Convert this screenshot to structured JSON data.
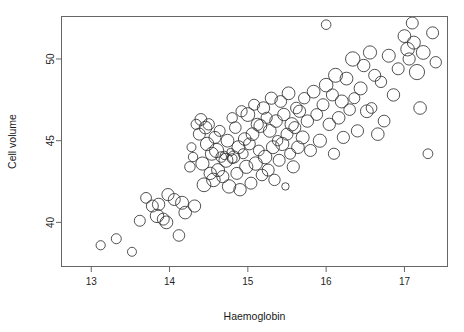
{
  "chart_data": {
    "type": "scatter",
    "variant": "bubble",
    "title": "",
    "subtitle": "",
    "xlabel": "Haemoglobin",
    "ylabel": "Cell volume",
    "xlim": [
      12.62,
      17.55
    ],
    "ylim": [
      37.3,
      52.6
    ],
    "xticks": [
      13,
      14,
      15,
      16,
      17
    ],
    "xticklabels": [
      "13",
      "14",
      "15",
      "16",
      "17"
    ],
    "yticks": [
      40,
      45,
      50
    ],
    "yticklabels": [
      "40",
      "45",
      "50"
    ],
    "grid": false,
    "legend": null,
    "marker": "open-circle",
    "marker_color": "#333333",
    "background": "#ffffff",
    "frame_color": "#666666",
    "annotations": [],
    "size_encoding": "circle radius proportional to a third variable (white cell count)",
    "n_points": 132,
    "points": [
      {
        "x": 13.12,
        "y": 38.6,
        "r": 9.2
      },
      {
        "x": 13.32,
        "y": 39.0,
        "r": 10.0
      },
      {
        "x": 13.52,
        "y": 38.2,
        "r": 9.0
      },
      {
        "x": 13.62,
        "y": 40.1,
        "r": 11.0
      },
      {
        "x": 13.7,
        "y": 41.5,
        "r": 10.8
      },
      {
        "x": 13.78,
        "y": 41.0,
        "r": 12.0
      },
      {
        "x": 13.84,
        "y": 40.4,
        "r": 13.5
      },
      {
        "x": 13.86,
        "y": 41.1,
        "r": 12.4
      },
      {
        "x": 13.92,
        "y": 40.2,
        "r": 12.0
      },
      {
        "x": 13.96,
        "y": 40.0,
        "r": 12.8
      },
      {
        "x": 13.98,
        "y": 41.7,
        "r": 12.2
      },
      {
        "x": 14.06,
        "y": 41.4,
        "r": 12.0
      },
      {
        "x": 14.12,
        "y": 39.2,
        "r": 11.6
      },
      {
        "x": 14.16,
        "y": 41.2,
        "r": 13.0
      },
      {
        "x": 14.2,
        "y": 40.6,
        "r": 12.6
      },
      {
        "x": 14.26,
        "y": 43.4,
        "r": 10.5
      },
      {
        "x": 14.28,
        "y": 44.6,
        "r": 9.0
      },
      {
        "x": 14.3,
        "y": 44.0,
        "r": 9.4
      },
      {
        "x": 14.32,
        "y": 41.0,
        "r": 12.2
      },
      {
        "x": 14.34,
        "y": 46.0,
        "r": 10.2
      },
      {
        "x": 14.38,
        "y": 45.4,
        "r": 12.0
      },
      {
        "x": 14.4,
        "y": 46.3,
        "r": 11.8
      },
      {
        "x": 14.42,
        "y": 43.6,
        "r": 13.2
      },
      {
        "x": 14.44,
        "y": 42.3,
        "r": 13.8
      },
      {
        "x": 14.46,
        "y": 45.8,
        "r": 12.6
      },
      {
        "x": 14.48,
        "y": 44.8,
        "r": 13.4
      },
      {
        "x": 14.5,
        "y": 46.0,
        "r": 11.4
      },
      {
        "x": 14.52,
        "y": 43.0,
        "r": 12.4
      },
      {
        "x": 14.54,
        "y": 44.2,
        "r": 13.0
      },
      {
        "x": 14.56,
        "y": 42.6,
        "r": 13.6
      },
      {
        "x": 14.58,
        "y": 45.2,
        "r": 12.0
      },
      {
        "x": 14.6,
        "y": 44.4,
        "r": 14.2
      },
      {
        "x": 14.62,
        "y": 43.2,
        "r": 13.0
      },
      {
        "x": 14.64,
        "y": 45.6,
        "r": 11.0
      },
      {
        "x": 14.66,
        "y": 44.0,
        "r": 10.6
      },
      {
        "x": 14.68,
        "y": 42.8,
        "r": 12.2
      },
      {
        "x": 14.7,
        "y": 44.1,
        "r": 8.4
      },
      {
        "x": 14.72,
        "y": 43.8,
        "r": 14.0
      },
      {
        "x": 14.74,
        "y": 45.0,
        "r": 12.8
      },
      {
        "x": 14.76,
        "y": 42.2,
        "r": 13.4
      },
      {
        "x": 14.78,
        "y": 44.3,
        "r": 7.6
      },
      {
        "x": 14.8,
        "y": 43.9,
        "r": 9.8
      },
      {
        "x": 14.8,
        "y": 46.4,
        "r": 10.4
      },
      {
        "x": 14.82,
        "y": 44.0,
        "r": 12.2
      },
      {
        "x": 14.84,
        "y": 45.8,
        "r": 11.6
      },
      {
        "x": 14.86,
        "y": 43.0,
        "r": 12.0
      },
      {
        "x": 14.88,
        "y": 44.6,
        "r": 13.0
      },
      {
        "x": 14.9,
        "y": 42.0,
        "r": 12.4
      },
      {
        "x": 14.92,
        "y": 46.8,
        "r": 11.2
      },
      {
        "x": 14.94,
        "y": 44.2,
        "r": 10.0
      },
      {
        "x": 14.96,
        "y": 45.1,
        "r": 12.6
      },
      {
        "x": 14.98,
        "y": 43.4,
        "r": 13.2
      },
      {
        "x": 15.0,
        "y": 46.6,
        "r": 13.8
      },
      {
        "x": 15.02,
        "y": 44.8,
        "r": 11.8
      },
      {
        "x": 15.04,
        "y": 42.4,
        "r": 12.0
      },
      {
        "x": 15.06,
        "y": 45.4,
        "r": 12.8
      },
      {
        "x": 15.08,
        "y": 47.2,
        "r": 11.0
      },
      {
        "x": 15.1,
        "y": 43.6,
        "r": 13.4
      },
      {
        "x": 15.12,
        "y": 46.0,
        "r": 12.2
      },
      {
        "x": 15.14,
        "y": 44.4,
        "r": 10.8
      },
      {
        "x": 15.16,
        "y": 45.9,
        "r": 13.0
      },
      {
        "x": 15.18,
        "y": 42.9,
        "r": 11.6
      },
      {
        "x": 15.2,
        "y": 47.0,
        "r": 12.4
      },
      {
        "x": 15.22,
        "y": 44.0,
        "r": 13.6
      },
      {
        "x": 15.24,
        "y": 46.4,
        "r": 11.2
      },
      {
        "x": 15.26,
        "y": 43.2,
        "r": 12.0
      },
      {
        "x": 15.28,
        "y": 45.6,
        "r": 12.8
      },
      {
        "x": 15.3,
        "y": 47.6,
        "r": 12.2
      },
      {
        "x": 15.32,
        "y": 44.6,
        "r": 13.0
      },
      {
        "x": 15.34,
        "y": 42.6,
        "r": 11.4
      },
      {
        "x": 15.36,
        "y": 46.2,
        "r": 12.6
      },
      {
        "x": 15.38,
        "y": 45.0,
        "r": 10.4
      },
      {
        "x": 15.4,
        "y": 43.8,
        "r": 12.0
      },
      {
        "x": 15.42,
        "y": 47.4,
        "r": 11.8
      },
      {
        "x": 15.44,
        "y": 44.8,
        "r": 13.2
      },
      {
        "x": 15.46,
        "y": 46.6,
        "r": 12.4
      },
      {
        "x": 15.48,
        "y": 42.2,
        "r": 7.4
      },
      {
        "x": 15.5,
        "y": 45.4,
        "r": 12.0
      },
      {
        "x": 15.52,
        "y": 47.9,
        "r": 12.8
      },
      {
        "x": 15.54,
        "y": 44.2,
        "r": 11.0
      },
      {
        "x": 15.56,
        "y": 46.0,
        "r": 13.4
      },
      {
        "x": 15.58,
        "y": 43.4,
        "r": 12.2
      },
      {
        "x": 15.6,
        "y": 45.8,
        "r": 12.0
      },
      {
        "x": 15.62,
        "y": 47.0,
        "r": 11.6
      },
      {
        "x": 15.64,
        "y": 44.6,
        "r": 12.6
      },
      {
        "x": 15.66,
        "y": 46.8,
        "r": 12.2
      },
      {
        "x": 15.7,
        "y": 45.2,
        "r": 13.0
      },
      {
        "x": 15.72,
        "y": 47.6,
        "r": 11.4
      },
      {
        "x": 15.76,
        "y": 46.2,
        "r": 12.4
      },
      {
        "x": 15.8,
        "y": 44.4,
        "r": 12.0
      },
      {
        "x": 15.84,
        "y": 48.0,
        "r": 12.8
      },
      {
        "x": 15.88,
        "y": 46.6,
        "r": 11.8
      },
      {
        "x": 15.92,
        "y": 45.0,
        "r": 13.2
      },
      {
        "x": 15.96,
        "y": 47.2,
        "r": 12.0
      },
      {
        "x": 16.0,
        "y": 48.4,
        "r": 13.6
      },
      {
        "x": 16.0,
        "y": 52.1,
        "r": 9.6
      },
      {
        "x": 16.04,
        "y": 46.0,
        "r": 12.4
      },
      {
        "x": 16.08,
        "y": 47.8,
        "r": 12.0
      },
      {
        "x": 16.1,
        "y": 44.2,
        "r": 11.2
      },
      {
        "x": 16.12,
        "y": 49.0,
        "r": 14.0
      },
      {
        "x": 16.16,
        "y": 46.4,
        "r": 12.6
      },
      {
        "x": 16.2,
        "y": 47.4,
        "r": 13.0
      },
      {
        "x": 16.22,
        "y": 45.2,
        "r": 12.2
      },
      {
        "x": 16.26,
        "y": 48.8,
        "r": 12.8
      },
      {
        "x": 16.3,
        "y": 46.9,
        "r": 11.6
      },
      {
        "x": 16.34,
        "y": 50.0,
        "r": 14.4
      },
      {
        "x": 16.36,
        "y": 47.6,
        "r": 11.0
      },
      {
        "x": 16.4,
        "y": 45.6,
        "r": 12.2
      },
      {
        "x": 16.44,
        "y": 48.2,
        "r": 13.0
      },
      {
        "x": 16.48,
        "y": 49.6,
        "r": 12.4
      },
      {
        "x": 16.52,
        "y": 46.8,
        "r": 12.8
      },
      {
        "x": 16.56,
        "y": 50.4,
        "r": 13.2
      },
      {
        "x": 16.58,
        "y": 47.0,
        "r": 10.8
      },
      {
        "x": 16.62,
        "y": 49.0,
        "r": 12.0
      },
      {
        "x": 16.66,
        "y": 45.4,
        "r": 12.6
      },
      {
        "x": 16.7,
        "y": 48.6,
        "r": 11.4
      },
      {
        "x": 16.74,
        "y": 46.2,
        "r": 11.8
      },
      {
        "x": 16.8,
        "y": 50.2,
        "r": 13.0
      },
      {
        "x": 16.86,
        "y": 47.8,
        "r": 12.4
      },
      {
        "x": 16.92,
        "y": 49.4,
        "r": 12.0
      },
      {
        "x": 17.0,
        "y": 51.4,
        "r": 12.8
      },
      {
        "x": 17.04,
        "y": 50.6,
        "r": 13.6
      },
      {
        "x": 17.06,
        "y": 50.0,
        "r": 12.2
      },
      {
        "x": 17.1,
        "y": 52.2,
        "r": 12.0
      },
      {
        "x": 17.12,
        "y": 51.0,
        "r": 13.0
      },
      {
        "x": 17.16,
        "y": 49.2,
        "r": 15.2
      },
      {
        "x": 17.2,
        "y": 47.0,
        "r": 12.6
      },
      {
        "x": 17.24,
        "y": 50.4,
        "r": 13.8
      },
      {
        "x": 17.3,
        "y": 44.2,
        "r": 9.8
      },
      {
        "x": 17.36,
        "y": 51.6,
        "r": 12.0
      },
      {
        "x": 17.4,
        "y": 49.8,
        "r": 11.4
      }
    ]
  },
  "axes": {
    "x_title": "Haemoglobin",
    "y_title": "Cell volume"
  }
}
